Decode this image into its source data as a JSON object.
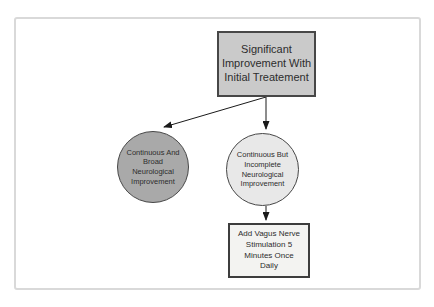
{
  "diagram": {
    "type": "flowchart",
    "background_color": "#ffffff",
    "frame_border_color": "#d9d9d9",
    "arrow_color": "#1a1a1a",
    "text_color": "#2d2d2d",
    "nodes": {
      "root": {
        "id": "root",
        "shape": "rectangle",
        "label": "Significant\nImprovement With\nInitial Treatement",
        "fill": "#cacaca",
        "border_color": "#474747"
      },
      "broad": {
        "id": "broad",
        "shape": "circle",
        "label": "Continuous And\nBroad\nNeurological\nImprovement",
        "fill": "#a9a9a9",
        "border_color": "#474747"
      },
      "incomplete": {
        "id": "incomplete",
        "shape": "circle",
        "label": "Continuous But\nIncomplete\nNeurological\nImprovement",
        "fill": "#e8e8e8",
        "border_color": "#474747"
      },
      "action": {
        "id": "action",
        "shape": "rectangle",
        "label": "Add Vagus Nerve\nStimulation 5\nMinutes Once\nDaily",
        "fill": "#f3f3f1",
        "border_color": "#3d3d3d"
      }
    },
    "edges": [
      {
        "from": "root",
        "to": "broad",
        "style": "arrow"
      },
      {
        "from": "root",
        "to": "incomplete",
        "style": "arrow"
      },
      {
        "from": "incomplete",
        "to": "action",
        "style": "arrow"
      }
    ]
  }
}
